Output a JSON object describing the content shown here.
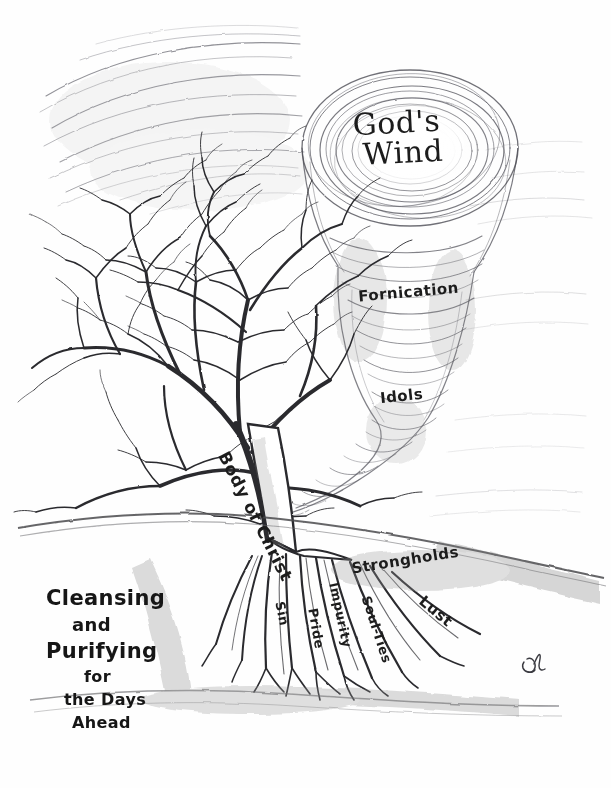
{
  "artwork": {
    "title": "Cleansing and Purifying for the Days Ahead",
    "medium": "pencil drawing",
    "background_color": "#fefefe",
    "ink_color": "#1c1c1c"
  },
  "tornado": {
    "name": "God's Wind tornado",
    "top_label_line1": "God's",
    "top_label_line2": "Wind",
    "labels": [
      {
        "text": "Fornication"
      },
      {
        "text": "Idols"
      }
    ]
  },
  "tree": {
    "name": "bare tree / Body of Christ",
    "trunk_label": "Body of Christ",
    "root_labels": [
      {
        "text": "Sin"
      },
      {
        "text": "Pride"
      },
      {
        "text": "Impurity"
      },
      {
        "text": "Soul-Ties"
      },
      {
        "text": "Strongholds"
      },
      {
        "text": "Lust"
      }
    ]
  },
  "caption": {
    "line1": "Cleansing",
    "line2": "and",
    "line3": "Purifying",
    "line4": "for",
    "line5": "the Days",
    "line6": "Ahead"
  },
  "signature": {
    "text": "DC"
  }
}
